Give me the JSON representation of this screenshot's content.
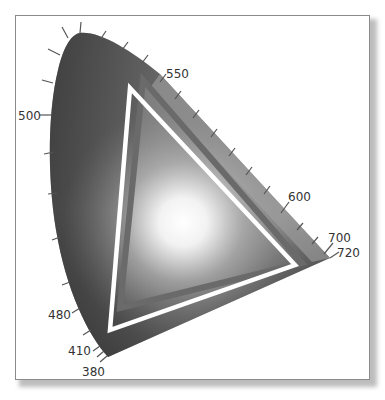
{
  "diagram": {
    "type": "CIE chromaticity horseshoe with gamut triangles",
    "rendering": "grayscale",
    "wavelength_labels": [
      {
        "id": "wl-500",
        "text": "500"
      },
      {
        "id": "wl-550",
        "text": "550"
      },
      {
        "id": "wl-600",
        "text": "600"
      },
      {
        "id": "wl-700",
        "text": "700"
      },
      {
        "id": "wl-720",
        "text": "720"
      },
      {
        "id": "wl-480",
        "text": "480"
      },
      {
        "id": "wl-410",
        "text": "410"
      },
      {
        "id": "wl-380",
        "text": "380"
      }
    ],
    "gamuts": [
      {
        "name": "outer-white-triangle",
        "color": "#ffffff"
      },
      {
        "name": "inner-gray-triangle",
        "color": "#6e6e6e"
      }
    ],
    "colors": {
      "locus_dark": "#3a3a3a",
      "locus_mid": "#8a8a8a",
      "white_point_glow": "#ffffff",
      "tick": "#555555",
      "frame_border": "#8a8a8a"
    }
  }
}
